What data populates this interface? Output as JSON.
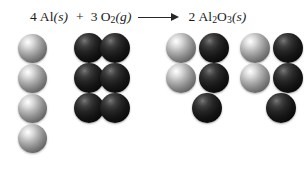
{
  "figure": {
    "background_color": "#ffffff"
  },
  "equation": {
    "reactant_1": {
      "coefficient": "4",
      "formula": "Al",
      "state": "(s)"
    },
    "plus": "+",
    "reactant_2": {
      "coefficient": "3",
      "formula_main": "O",
      "formula_sub": "2",
      "state": "(g)"
    },
    "arrow": "⟶",
    "product_1": {
      "coefficient": "2",
      "formula_main_1": "Al",
      "formula_sub_1": "2",
      "formula_main_2": "O",
      "formula_sub_2": "3",
      "state": "(s)"
    },
    "full_text": "4 Al(s) + 3 O2(g) ⟶ 2 Al2O3(s)"
  },
  "legend": {
    "aluminum_color": "#b3b3b3",
    "oxygen_color": "#0b0b0b",
    "aluminum_label": "Al",
    "oxygen_label": "O"
  },
  "models": {
    "reactants": {
      "aluminum_atoms": {
        "count": 4,
        "label": "aluminum-atom",
        "positions": [
          {
            "x": 18,
            "y": 34
          },
          {
            "x": 18,
            "y": 64
          },
          {
            "x": 18,
            "y": 94
          },
          {
            "x": 18,
            "y": 124
          }
        ],
        "diameter": 29
      },
      "oxygen_molecules": {
        "count": 3,
        "label": "oxygen-molecule",
        "atoms_per_molecule": 2,
        "positions": [
          {
            "x": 74,
            "y": 33
          },
          {
            "x": 74,
            "y": 63
          },
          {
            "x": 74,
            "y": 93
          }
        ],
        "diameter": 30,
        "pair_offset": 26
      }
    },
    "products": {
      "units": {
        "count": 2,
        "label": "aluminum-oxide-unit",
        "positions": [
          {
            "x": 166,
            "y": 33
          },
          {
            "x": 240,
            "y": 33
          }
        ],
        "aluminum_per_unit": 2,
        "oxygen_per_unit": 3,
        "diameter": 30,
        "column_offset": 33,
        "row_offset": 30
      }
    }
  }
}
